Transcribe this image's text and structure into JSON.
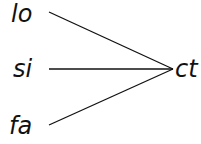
{
  "diagram": {
    "left_nodes": [
      {
        "label": "lo"
      },
      {
        "label": "si"
      },
      {
        "label": "fa"
      }
    ],
    "right_node": {
      "label": "ct"
    },
    "colors": {
      "stroke": "#111111",
      "text": "#111111",
      "background": "#ffffff"
    }
  }
}
